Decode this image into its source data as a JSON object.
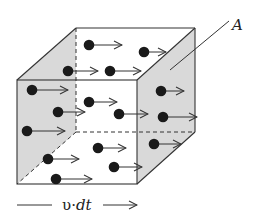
{
  "figure": {
    "colors": {
      "edge": "#333333",
      "face_shaded": "#d9d9d9",
      "particle": "#1a1a1a",
      "background": "#ffffff"
    },
    "labels": {
      "area": "A",
      "length_symbol": "υ",
      "length_dot": "·",
      "length_dt": "dt"
    },
    "cube": {
      "front": {
        "x1": 17,
        "y1": 80,
        "x2": 137,
        "y2": 184
      },
      "back": {
        "x1": 76,
        "y1": 28,
        "x2": 195,
        "y2": 132
      }
    },
    "particles": [
      {
        "x": 89,
        "y": 45,
        "arrow_end": 122
      },
      {
        "x": 144,
        "y": 52,
        "arrow_end": 166
      },
      {
        "x": 68,
        "y": 71,
        "arrow_end": 98
      },
      {
        "x": 110,
        "y": 71,
        "arrow_end": 141
      },
      {
        "x": 32,
        "y": 90,
        "arrow_end": 68
      },
      {
        "x": 161,
        "y": 91,
        "arrow_end": 184
      },
      {
        "x": 89,
        "y": 102,
        "arrow_end": 117
      },
      {
        "x": 58,
        "y": 112,
        "arrow_end": 85
      },
      {
        "x": 119,
        "y": 114,
        "arrow_end": 148
      },
      {
        "x": 163,
        "y": 117,
        "arrow_end": 197
      },
      {
        "x": 27,
        "y": 131,
        "arrow_end": 65
      },
      {
        "x": 154,
        "y": 144,
        "arrow_end": 181
      },
      {
        "x": 98,
        "y": 148,
        "arrow_end": 126
      },
      {
        "x": 48,
        "y": 159,
        "arrow_end": 79
      },
      {
        "x": 114,
        "y": 167,
        "arrow_end": 142
      },
      {
        "x": 56,
        "y": 179,
        "arrow_end": 92
      }
    ]
  }
}
